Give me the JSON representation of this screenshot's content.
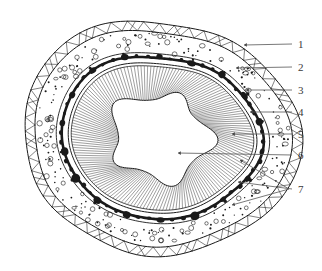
{
  "figure": {
    "background_color": "#ffffff",
    "ink_color": "#1a1a1a",
    "label_color": "#3a3a3a",
    "width": 322,
    "height": 271,
    "top_text_remnant": ""
  },
  "labels": [
    {
      "id": "1",
      "text": "1",
      "x": 298,
      "y": 39,
      "leader_from_x": 292,
      "leader_from_y": 44,
      "leader_to_x": 244,
      "leader_to_y": 45,
      "points_to": "outer-zigzag-band"
    },
    {
      "id": "2",
      "text": "2",
      "x": 298,
      "y": 62,
      "leader_from_x": 292,
      "leader_from_y": 67,
      "leader_to_x": 236,
      "leader_to_y": 68,
      "points_to": "stippled-cortex-layer"
    },
    {
      "id": "3",
      "text": "3",
      "x": 298,
      "y": 85,
      "leader_from_x": 292,
      "leader_from_y": 90,
      "leader_to_x": 246,
      "leader_to_y": 90,
      "points_to": "dark-nodular-ring"
    },
    {
      "id": "4",
      "text": "4",
      "x": 298,
      "y": 107,
      "leader_from_x": 292,
      "leader_from_y": 112,
      "leader_to_x": 250,
      "leader_to_y": 112,
      "points_to": "inner-boundary-line"
    },
    {
      "id": "5",
      "text": "5",
      "x": 298,
      "y": 129,
      "leader_from_x": 292,
      "leader_from_y": 134,
      "leader_to_x": 232,
      "leader_to_y": 134,
      "points_to": "radial-striation-zone"
    },
    {
      "id": "6",
      "text": "6",
      "x": 298,
      "y": 150,
      "leader_from_x": 292,
      "leader_from_y": 155,
      "leader_to_x": 178,
      "leader_to_y": 153,
      "points_to": "central-cavity"
    },
    {
      "id": "7",
      "text": "7",
      "x": 298,
      "y": 184,
      "leader_from_x": 292,
      "leader_from_y": 189,
      "leader_to_x": 238,
      "leader_to_y": 182,
      "points_to": "outer-wall-branch"
    }
  ],
  "leader_branches": [
    {
      "name": "label-7-branch-upper",
      "from_x": 289,
      "from_y": 189,
      "to_x": 240,
      "to_y": 160
    },
    {
      "name": "label-7-branch-lower",
      "from_x": 289,
      "from_y": 189,
      "to_x": 232,
      "to_y": 205
    }
  ],
  "layers": [
    {
      "id": "outer-zigzag-band",
      "name": "Outer zigzag hatched band",
      "style": "double-outline with V/X cross hatching"
    },
    {
      "id": "stippled-cortex-layer",
      "name": "Stippled cortex layer",
      "style": "scattered dots and small circles"
    },
    {
      "id": "dark-nodular-ring",
      "name": "Dark nodular ring",
      "style": "thick irregular black blobs"
    },
    {
      "id": "inner-boundary-line",
      "name": "Inner boundary line",
      "style": "thin closed contour"
    },
    {
      "id": "radial-striation-zone",
      "name": "Radial striation zone",
      "style": "dense radiating fine lines"
    },
    {
      "id": "central-cavity",
      "name": "Central cavity",
      "style": "white star-shaped lumen"
    }
  ]
}
